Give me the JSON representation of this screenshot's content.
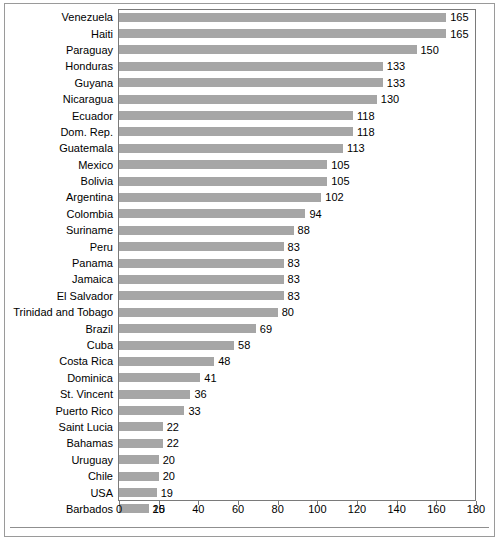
{
  "chart_data": {
    "type": "bar",
    "orientation": "horizontal",
    "title": "",
    "subtitle": "",
    "xlabel": "",
    "ylabel": "",
    "xlim": [
      0,
      180
    ],
    "xticks": [
      0,
      20,
      40,
      60,
      80,
      100,
      120,
      140,
      160,
      180
    ],
    "grid": false,
    "legend": null,
    "bar_color": "#a6a6a6",
    "categories": [
      "Venezuela",
      "Haiti",
      "Paraguay",
      "Honduras",
      "Guyana",
      "Nicaragua",
      "Ecuador",
      "Dom. Rep.",
      "Guatemala",
      "Mexico",
      "Bolivia",
      "Argentina",
      "Colombia",
      "Suriname",
      "Peru",
      "Panama",
      "Jamaica",
      "El Salvador",
      "Trinidad and Tobago",
      "Brazil",
      "Cuba",
      "Costa Rica",
      "Dominica",
      "St. Vincent",
      "Puerto Rico",
      "Saint Lucia",
      "Bahamas",
      "Uruguay",
      "Chile",
      "USA",
      "Barbados"
    ],
    "values": [
      165,
      165,
      150,
      133,
      133,
      130,
      118,
      118,
      113,
      105,
      105,
      102,
      94,
      88,
      83,
      83,
      83,
      83,
      80,
      69,
      58,
      48,
      41,
      36,
      33,
      22,
      22,
      20,
      20,
      19,
      15
    ]
  }
}
